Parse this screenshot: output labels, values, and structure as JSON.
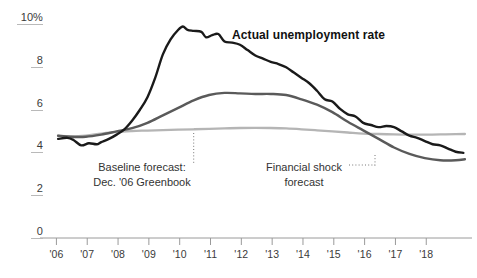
{
  "chart_data": {
    "type": "line",
    "title": "",
    "xlabel": "",
    "ylabel": "",
    "ylim": [
      0,
      10
    ],
    "xlim": [
      2005.5,
      2018.9
    ],
    "grid": false,
    "legend_position": "inline-annotations",
    "y_ticks": [
      "0",
      "2",
      "4",
      "6",
      "8",
      "10%"
    ],
    "y_tick_values": [
      0,
      2,
      4,
      6,
      8,
      10
    ],
    "x_ticks": [
      "'06",
      "'07",
      "'08",
      "'09",
      "'10",
      "'11",
      "'12",
      "'13",
      "'14",
      "'15",
      "'16",
      "'17",
      "'18"
    ],
    "x_tick_values": [
      2006,
      2007,
      2008,
      2009,
      2010,
      2011,
      2012,
      2013,
      2014,
      2015,
      2016,
      2017,
      2018
    ],
    "series": [
      {
        "name": "Actual unemployment rate",
        "color": "#1a1a1a",
        "width": 2.4,
        "x": [
          2005.6,
          2005.9,
          2006.1,
          2006.35,
          2006.6,
          2006.85,
          2007.0,
          2007.25,
          2007.5,
          2007.75,
          2008.0,
          2008.25,
          2008.5,
          2008.75,
          2009.0,
          2009.25,
          2009.5,
          2009.65,
          2009.8,
          2010.0,
          2010.25,
          2010.4,
          2010.6,
          2010.8,
          2011.0,
          2011.25,
          2011.5,
          2011.75,
          2012.0,
          2012.25,
          2012.5,
          2012.75,
          2013.0,
          2013.25,
          2013.5,
          2013.75,
          2014.0,
          2014.25,
          2014.5,
          2014.75,
          2015.0,
          2015.25,
          2015.5,
          2015.75,
          2016.0,
          2016.25,
          2016.5,
          2016.75,
          2017.0,
          2017.25,
          2017.5,
          2017.75,
          2018.0,
          2018.25,
          2018.5,
          2018.75
        ],
        "y": [
          4.35,
          4.4,
          4.3,
          4.05,
          4.15,
          4.1,
          4.2,
          4.35,
          4.55,
          4.8,
          5.2,
          5.7,
          6.3,
          7.2,
          8.3,
          9.0,
          9.45,
          9.6,
          9.45,
          9.4,
          9.35,
          9.1,
          9.2,
          9.25,
          8.9,
          8.85,
          8.75,
          8.5,
          8.25,
          8.1,
          7.95,
          7.85,
          7.7,
          7.45,
          7.2,
          6.95,
          6.6,
          6.2,
          6.1,
          5.75,
          5.5,
          5.4,
          5.1,
          5.0,
          4.9,
          4.95,
          4.9,
          4.7,
          4.5,
          4.4,
          4.25,
          4.1,
          4.05,
          3.9,
          3.75,
          3.7
        ]
      },
      {
        "name": "Financial shock forecast",
        "color": "#5a5a5a",
        "width": 2.4,
        "x": [
          2005.6,
          2006.0,
          2006.5,
          2007.0,
          2007.5,
          2008.0,
          2008.5,
          2009.0,
          2009.5,
          2010.0,
          2010.5,
          2011.0,
          2011.5,
          2012.0,
          2012.5,
          2013.0,
          2013.5,
          2014.0,
          2014.5,
          2015.0,
          2015.5,
          2016.0,
          2016.5,
          2017.0,
          2017.5,
          2018.0,
          2018.5,
          2018.8
        ],
        "y": [
          4.5,
          4.45,
          4.45,
          4.55,
          4.7,
          4.85,
          5.1,
          5.45,
          5.8,
          6.15,
          6.4,
          6.5,
          6.48,
          6.45,
          6.45,
          6.4,
          6.2,
          5.95,
          5.6,
          5.15,
          4.75,
          4.35,
          3.95,
          3.65,
          3.45,
          3.35,
          3.35,
          3.4
        ]
      },
      {
        "name": "Baseline forecast: Dec. '06 Greenbook",
        "color": "#b5b5b5",
        "width": 2.3,
        "x": [
          2005.6,
          2006.0,
          2006.5,
          2007.0,
          2007.5,
          2008.0,
          2008.5,
          2009.0,
          2009.5,
          2010.0,
          2010.5,
          2011.0,
          2011.5,
          2012.0,
          2012.5,
          2013.0,
          2013.5,
          2014.0,
          2014.5,
          2015.0,
          2015.5,
          2016.0,
          2016.5,
          2017.0,
          2017.5,
          2018.0,
          2018.5,
          2018.8
        ],
        "y": [
          4.5,
          4.47,
          4.5,
          4.6,
          4.68,
          4.72,
          4.74,
          4.76,
          4.78,
          4.8,
          4.82,
          4.84,
          4.86,
          4.87,
          4.86,
          4.84,
          4.8,
          4.75,
          4.7,
          4.65,
          4.6,
          4.58,
          4.56,
          4.55,
          4.55,
          4.56,
          4.57,
          4.58
        ]
      }
    ],
    "annotations": [
      {
        "name": "actual-series-label",
        "text": "Actual unemployment rate",
        "bold": true
      },
      {
        "name": "baseline-forecast-annotation",
        "line1": "Baseline forecast:",
        "line2": "Dec. '06 Greenbook",
        "leader": "vertical-dotted"
      },
      {
        "name": "financial-shock-annotation",
        "line1": "Financial shock",
        "line2": "forecast",
        "leader": "horizontal-dotted"
      }
    ]
  },
  "colors": {
    "actual": "#1a1a1a",
    "financial_shock": "#5a5a5a",
    "baseline": "#b5b5b5",
    "axis": "#9a9a9a",
    "text": "#333333",
    "background": "#ffffff"
  }
}
